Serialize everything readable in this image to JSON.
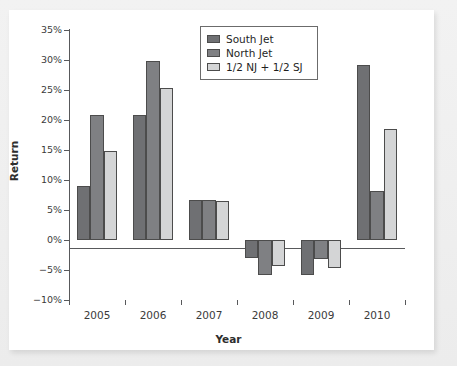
{
  "chart_data": {
    "type": "bar",
    "title": "",
    "xlabel": "Year",
    "ylabel": "Return",
    "categories": [
      "2005",
      "2006",
      "2007",
      "2008",
      "2009",
      "2010"
    ],
    "series": [
      {
        "name": "South Jet",
        "color": "#6f7073",
        "values": [
          9.0,
          20.8,
          6.7,
          -3.0,
          -5.9,
          29.1
        ]
      },
      {
        "name": "North Jet",
        "color": "#7f8083",
        "values": [
          20.9,
          29.8,
          6.7,
          -5.8,
          -3.2,
          8.2
        ]
      },
      {
        "name": "1/2 NJ + 1/2 SJ",
        "color": "#d4d5d6",
        "values": [
          14.9,
          25.3,
          6.5,
          -4.4,
          -4.6,
          18.5
        ]
      }
    ],
    "ylim": [
      -10,
      35
    ],
    "ytick_values": [
      35,
      30,
      25,
      20,
      15,
      10,
      5,
      0,
      -5,
      -10
    ],
    "ytick_labels": [
      "35%",
      "30%",
      "25%",
      "20%",
      "15%",
      "10%",
      "5%",
      "0%",
      "−5%",
      "−10%"
    ],
    "grid": false,
    "legend_position": "top-center",
    "units": "percent"
  },
  "legend": {
    "entries": [
      {
        "label": "South Jet",
        "swatch": "legend-swatch-south-jet"
      },
      {
        "label": "North Jet",
        "swatch": "legend-swatch-north-jet"
      },
      {
        "label": "1/2 NJ + 1/2 SJ",
        "swatch": "legend-swatch-blend"
      }
    ]
  },
  "axes": {
    "x_title": "Year",
    "y_title": "Return"
  },
  "colors": {
    "series_south_jet": "#6f7073",
    "series_north_jet": "#7f8083",
    "series_blend": "#d4d5d6",
    "axis": "#58595b",
    "panel_background": "#ffffff",
    "figure_background": "#ececec"
  }
}
